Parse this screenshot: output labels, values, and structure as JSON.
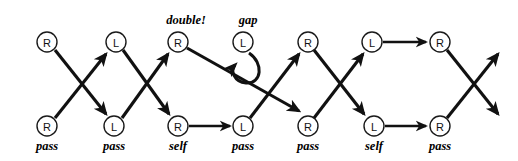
{
  "diagram": {
    "type": "braid-juggling-siteswap-diagram",
    "background_color": "#ffffff",
    "stroke_color": "#111111",
    "node_fill": "#ffffff",
    "canvas": {
      "width": 518,
      "height": 161
    },
    "geometry": {
      "node_radius": 10,
      "top_row_y": 42,
      "bottom_row_y": 126,
      "label_y": 148,
      "annotation_y": 24,
      "columns_top_x": [
        47,
        116,
        178,
        243,
        308,
        372,
        440
      ],
      "columns_bottom_x": [
        47,
        114,
        178,
        243,
        308,
        374,
        440
      ]
    },
    "top_row": [
      {
        "id": "t0",
        "letter": "R",
        "x": 47,
        "y": 42
      },
      {
        "id": "t1",
        "letter": "L",
        "x": 116,
        "y": 42
      },
      {
        "id": "t2",
        "letter": "R",
        "x": 178,
        "y": 42,
        "annotation": "double!"
      },
      {
        "id": "t3",
        "letter": "L",
        "x": 243,
        "y": 42,
        "annotation": "gap"
      },
      {
        "id": "t4",
        "letter": "R",
        "x": 308,
        "y": 42
      },
      {
        "id": "t5",
        "letter": "L",
        "x": 372,
        "y": 42
      },
      {
        "id": "t6",
        "letter": "R",
        "x": 440,
        "y": 42
      }
    ],
    "bottom_row": [
      {
        "id": "b0",
        "letter": "R",
        "x": 47,
        "y": 126,
        "label": "pass"
      },
      {
        "id": "b1",
        "letter": "L",
        "x": 114,
        "y": 126,
        "label": "pass"
      },
      {
        "id": "b2",
        "letter": "R",
        "x": 178,
        "y": 126,
        "label": "self"
      },
      {
        "id": "b3",
        "letter": "L",
        "x": 243,
        "y": 126,
        "label": "pass"
      },
      {
        "id": "b4",
        "letter": "R",
        "x": 308,
        "y": 126,
        "label": "pass"
      },
      {
        "id": "b5",
        "letter": "L",
        "x": 374,
        "y": 126,
        "label": "self"
      },
      {
        "id": "b6",
        "letter": "R",
        "x": 440,
        "y": 126,
        "label": "pass"
      }
    ],
    "annotations": [
      {
        "id": "a-double",
        "text": "double!",
        "x": 186,
        "y": 24
      },
      {
        "id": "a-gap",
        "text": "gap",
        "x": 248,
        "y": 24
      }
    ],
    "slot_labels": [
      {
        "text": "pass",
        "x": 47
      },
      {
        "text": "pass",
        "x": 114
      },
      {
        "text": "self",
        "x": 178
      },
      {
        "text": "pass",
        "x": 243
      },
      {
        "text": "pass",
        "x": 308
      },
      {
        "text": "self",
        "x": 374
      },
      {
        "text": "pass",
        "x": 440
      }
    ],
    "edges": [
      {
        "id": "e1",
        "kind": "cross-down",
        "from": "t0",
        "to": "b1",
        "x1": 55,
        "y1": 50,
        "x2": 108,
        "y2": 116
      },
      {
        "id": "e2",
        "kind": "cross-up",
        "from": "b0",
        "to": "t1",
        "x1": 55,
        "y1": 118,
        "x2": 108,
        "y2": 52
      },
      {
        "id": "e3",
        "kind": "cross-down",
        "from": "t1",
        "to": "b2",
        "x1": 123,
        "y1": 50,
        "x2": 171,
        "y2": 116
      },
      {
        "id": "e4",
        "kind": "cross-up",
        "from": "b1",
        "to": "t2",
        "x1": 122,
        "y1": 118,
        "x2": 170,
        "y2": 52
      },
      {
        "id": "e5",
        "kind": "long-double",
        "from": "t2",
        "to": "b4",
        "x1": 187,
        "y1": 48,
        "x2": 301,
        "y2": 113
      },
      {
        "id": "e6",
        "kind": "horizontal",
        "from": "b2",
        "to": "b3",
        "x1": 189,
        "y1": 126,
        "x2": 232,
        "y2": 126
      },
      {
        "id": "e7",
        "kind": "cross-up",
        "from": "b3",
        "to": "t4",
        "x1": 250,
        "y1": 118,
        "x2": 301,
        "y2": 52
      },
      {
        "id": "e8",
        "kind": "cross-down",
        "from": "t4",
        "to": "b5",
        "x1": 314,
        "y1": 50,
        "x2": 366,
        "y2": 116
      },
      {
        "id": "e9",
        "kind": "cross-up",
        "from": "b4",
        "to": "t5",
        "x1": 314,
        "y1": 118,
        "x2": 365,
        "y2": 52
      },
      {
        "id": "e10",
        "kind": "horizontal",
        "from": "t5",
        "to": "t6",
        "x1": 383,
        "y1": 42,
        "x2": 428,
        "y2": 42
      },
      {
        "id": "e11",
        "kind": "horizontal",
        "from": "b5",
        "to": "b6",
        "x1": 385,
        "y1": 126,
        "x2": 428,
        "y2": 126
      },
      {
        "id": "e12",
        "kind": "open-down",
        "from": "t6",
        "to": null,
        "x1": 447,
        "y1": 50,
        "x2": 500,
        "y2": 116
      },
      {
        "id": "e13",
        "kind": "open-up",
        "from": "b6",
        "to": null,
        "x1": 447,
        "y1": 118,
        "x2": 500,
        "y2": 52
      }
    ],
    "self_loop": {
      "id": "loop-gap",
      "on_node": "t3",
      "description": "self-loop curving down and left with arrowhead pointing left",
      "path": "M 248 52 C 262 62, 261 82, 246 82 C 234 82, 231 70, 236 66"
    }
  }
}
